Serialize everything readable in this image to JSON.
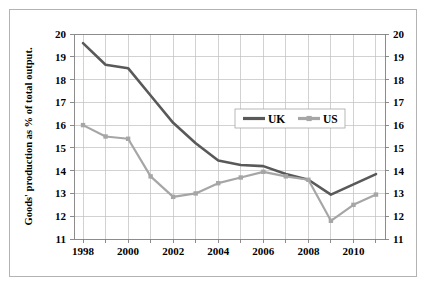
{
  "chart_data": {
    "type": "line",
    "title": "",
    "xlabel": "",
    "ylabel": "Goods' production as % of total output.",
    "x": [
      1998,
      1999,
      2000,
      2001,
      2002,
      2003,
      2004,
      2005,
      2006,
      2007,
      2008,
      2009,
      2010,
      2011
    ],
    "xlim": [
      1997.6,
      2011.4
    ],
    "ylim": [
      11,
      20
    ],
    "xtick_labels": [
      "1998",
      "2000",
      "2002",
      "2004",
      "2006",
      "2008",
      "2010"
    ],
    "xtick_values": [
      1998,
      2000,
      2002,
      2004,
      2006,
      2008,
      2010
    ],
    "xticks_minor": [
      1999,
      2001,
      2003,
      2005,
      2007,
      2009,
      2011
    ],
    "ytick_labels": [
      "11",
      "12",
      "13",
      "14",
      "15",
      "16",
      "17",
      "18",
      "19",
      "20"
    ],
    "ytick_values": [
      11,
      12,
      13,
      14,
      15,
      16,
      17,
      18,
      19,
      20
    ],
    "right_axis_labels": [
      "11",
      "12",
      "13",
      "14",
      "15",
      "16",
      "17",
      "18",
      "19",
      "20"
    ],
    "grid": true,
    "legend_position": "upper-center",
    "series": [
      {
        "name": "UK",
        "color": "#595959",
        "line_width": 2.6,
        "marker": "none",
        "values": [
          19.6,
          18.65,
          18.5,
          17.3,
          16.1,
          15.2,
          14.45,
          14.25,
          14.2,
          13.85,
          13.6,
          12.95,
          13.4,
          13.85
        ]
      },
      {
        "name": "US",
        "color": "#a6a6a6",
        "line_width": 2.2,
        "marker": "square",
        "values": [
          16.0,
          15.5,
          15.4,
          13.75,
          12.85,
          13.0,
          13.45,
          13.7,
          13.95,
          13.75,
          13.6,
          11.8,
          12.5,
          12.95
        ]
      }
    ]
  },
  "legend": {
    "entries": [
      {
        "label": "UK",
        "color": "#595959"
      },
      {
        "label": "US",
        "color": "#a6a6a6"
      }
    ]
  }
}
